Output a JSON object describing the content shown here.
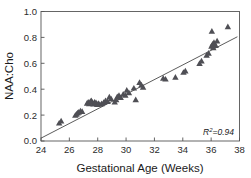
{
  "chart_data": {
    "type": "scatter",
    "title": "",
    "xlabel": "Gestational Age (Weeks)",
    "ylabel": "NAA:Cho",
    "xlim": [
      24,
      38
    ],
    "ylim": [
      0.0,
      1.0
    ],
    "xticks": [
      24,
      26,
      28,
      30,
      32,
      34,
      36,
      38
    ],
    "yticks": [
      "0.0",
      "0.2",
      "0.4",
      "0.6",
      "0.8",
      "1.0"
    ],
    "xtick_labels": [
      "24",
      "26",
      "28",
      "30",
      "32",
      "34",
      "36",
      "38"
    ],
    "ytick_labels": [
      "0.0",
      "0.2",
      "0.4",
      "0.6",
      "0.8",
      "1.0"
    ],
    "grid": false,
    "legend": false,
    "marker": "triangle",
    "marker_color": "#4f4f55",
    "annotations": [
      {
        "name": "r-squared",
        "text_prefix": "R",
        "text_sup": "2",
        "text_suffix": "=0.94",
        "x": 37.4,
        "y": 0.055,
        "italic": true
      }
    ],
    "trendline": {
      "type": "linear",
      "x_start": 24.0,
      "y_start": 0.022,
      "x_end": 37.85,
      "y_end": 0.805,
      "slope": 0.0565,
      "intercept": -1.335,
      "r_squared": 0.94,
      "color": "#4a4a4a"
    },
    "series": [
      {
        "name": "NAA:Cho vs Gestational Age",
        "points": [
          [
            25.28,
            0.138
          ],
          [
            25.42,
            0.155
          ],
          [
            26.42,
            0.198
          ],
          [
            26.5,
            0.207
          ],
          [
            26.58,
            0.216
          ],
          [
            26.66,
            0.222
          ],
          [
            26.78,
            0.232
          ],
          [
            26.9,
            0.228
          ],
          [
            27.25,
            0.292
          ],
          [
            27.33,
            0.3
          ],
          [
            27.4,
            0.288
          ],
          [
            27.48,
            0.305
          ],
          [
            27.55,
            0.312
          ],
          [
            27.62,
            0.298
          ],
          [
            27.7,
            0.285
          ],
          [
            27.78,
            0.3
          ],
          [
            27.88,
            0.296
          ],
          [
            27.96,
            0.282
          ],
          [
            28.05,
            0.29
          ],
          [
            28.15,
            0.283
          ],
          [
            28.28,
            0.288
          ],
          [
            28.42,
            0.297
          ],
          [
            28.55,
            0.312
          ],
          [
            28.7,
            0.305
          ],
          [
            28.82,
            0.34
          ],
          [
            28.95,
            0.325
          ],
          [
            29.2,
            0.3
          ],
          [
            29.3,
            0.318
          ],
          [
            29.38,
            0.342
          ],
          [
            29.5,
            0.352
          ],
          [
            29.62,
            0.335
          ],
          [
            29.8,
            0.362
          ],
          [
            29.95,
            0.352
          ],
          [
            30.05,
            0.392
          ],
          [
            30.2,
            0.372
          ],
          [
            30.55,
            0.408
          ],
          [
            30.68,
            0.318
          ],
          [
            30.95,
            0.452
          ],
          [
            31.08,
            0.432
          ],
          [
            31.2,
            0.415
          ],
          [
            32.62,
            0.485
          ],
          [
            32.78,
            0.478
          ],
          [
            33.48,
            0.492
          ],
          [
            34.05,
            0.53
          ],
          [
            34.18,
            0.54
          ],
          [
            35.18,
            0.598
          ],
          [
            35.32,
            0.618
          ],
          [
            35.68,
            0.662
          ],
          [
            35.82,
            0.678
          ],
          [
            36.02,
            0.732
          ],
          [
            36.1,
            0.748
          ],
          [
            36.15,
            0.72
          ],
          [
            36.2,
            0.76
          ],
          [
            36.05,
            0.848
          ],
          [
            36.32,
            0.738
          ],
          [
            36.42,
            0.772
          ],
          [
            37.18,
            0.882
          ]
        ]
      }
    ]
  }
}
